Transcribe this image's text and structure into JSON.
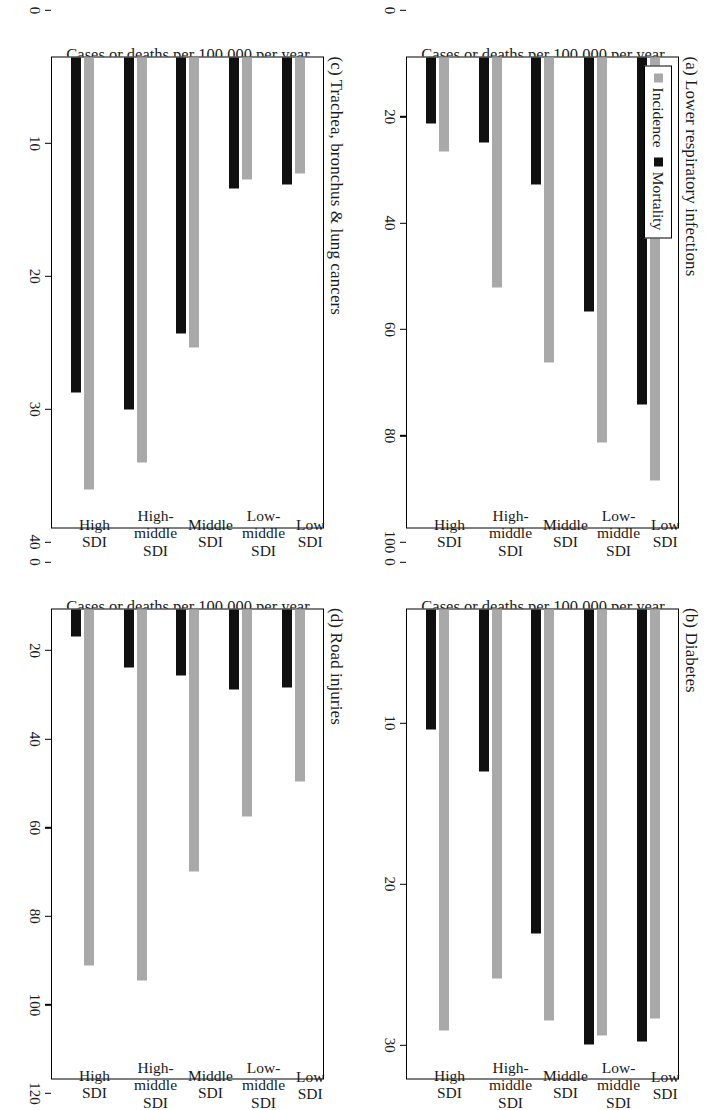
{
  "figure": {
    "ylabel": "Cases or deaths per 100,000 per year",
    "legend": [
      {
        "label": "Incidence",
        "color": "#a9a9a9",
        "key": "incidence"
      },
      {
        "label": "Mortality",
        "color": "#101010",
        "key": "mortality"
      }
    ],
    "categories": [
      "Low SDI",
      "Low-middle\nSDI",
      "Middle SDI",
      "High-middle\nSDI",
      "High SDI"
    ]
  },
  "chart_data": [
    {
      "type": "bar",
      "panel": "a",
      "title": "(a) Lower respiratory infections",
      "categories": [
        "Low SDI",
        "Low-middle SDI",
        "Middle SDI",
        "High-middle SDI",
        "High SDI"
      ],
      "series": [
        {
          "name": "Incidence",
          "values": [
            90,
            82,
            65,
            49,
            20
          ]
        },
        {
          "name": "Mortality",
          "values": [
            74,
            54,
            27,
            18,
            14
          ]
        }
      ],
      "xlabel": "",
      "ylabel": "Cases or deaths per 100,000 per year",
      "ylim": [
        0,
        100
      ],
      "yticks": [
        0,
        20,
        40,
        60,
        80,
        100
      ],
      "grid": false,
      "legend_position": "top-left"
    },
    {
      "type": "bar",
      "panel": "b",
      "title": "(b) Diabetes",
      "categories": [
        "Low SDI",
        "Low-middle SDI",
        "Middle SDI",
        "High-middle SDI",
        "High SDI"
      ],
      "series": [
        {
          "name": "Incidence",
          "values": [
            28.8,
            30.0,
            28.9,
            26.0,
            29.6
          ]
        },
        {
          "name": "Mortality",
          "values": [
            30.4,
            30.6,
            22.8,
            11.4,
            8.5
          ]
        }
      ],
      "xlabel": "",
      "ylabel": "Cases or deaths per 100,000 per year",
      "ylim": [
        0,
        33
      ],
      "yticks": [
        0,
        10,
        20,
        30
      ],
      "grid": false,
      "legend_position": "none"
    },
    {
      "type": "bar",
      "panel": "c",
      "title": "(c) Trachea, bronchus & lung cancers",
      "categories": [
        "Low SDI",
        "Low-middle SDI",
        "Middle SDI",
        "High-middle SDI",
        "High SDI"
      ],
      "series": [
        {
          "name": "Incidence",
          "values": [
            9.9,
            10.4,
            24.7,
            34.5,
            36.8
          ]
        },
        {
          "name": "Mortality",
          "values": [
            10.8,
            11.2,
            23.5,
            30.0,
            28.5
          ]
        }
      ],
      "xlabel": "",
      "ylabel": "Cases or deaths per 100,000 per year",
      "ylim": [
        0,
        40
      ],
      "yticks": [
        0,
        10,
        20,
        30,
        40
      ],
      "grid": false,
      "legend_position": "none"
    },
    {
      "type": "bar",
      "panel": "d",
      "title": "(d) Road injuries",
      "categories": [
        "Low SDI",
        "Low-middle SDI",
        "Middle SDI",
        "High-middle SDI",
        "High SDI"
      ],
      "series": [
        {
          "name": "Incidence",
          "values": [
            44,
            53,
            67,
            95,
            91
          ]
        },
        {
          "name": "Mortality",
          "values": [
            20,
            20.5,
            17,
            15,
            7
          ]
        }
      ],
      "xlabel": "",
      "ylabel": "Cases or deaths per 100,000 per year",
      "ylim": [
        0,
        120
      ],
      "yticks": [
        0,
        20,
        40,
        60,
        80,
        100,
        120
      ],
      "grid": false,
      "legend_position": "none"
    }
  ]
}
